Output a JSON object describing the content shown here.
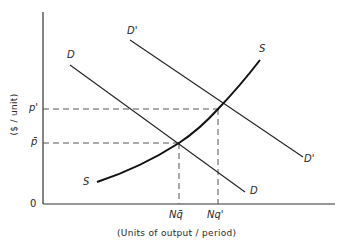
{
  "diagram": {
    "type": "supply-demand",
    "axes": {
      "x_label": "(Units of output / period)",
      "y_label": "($ / unit)",
      "origin_label": "0"
    },
    "curves": {
      "demand": {
        "label_start": "D",
        "label_end": "D"
      },
      "demand_shifted": {
        "label_start": "D'",
        "label_end": "D'"
      },
      "supply": {
        "label_start": "S",
        "label_end": "S"
      }
    },
    "price_labels": {
      "p_prime": "p'",
      "p_bar": "p̄"
    },
    "quantity_labels": {
      "nq_bar": "Nq̄",
      "nq_prime": "Nq'"
    },
    "colors": {
      "line": "#222222",
      "dashed": "#555555",
      "background": "#ffffff"
    }
  }
}
